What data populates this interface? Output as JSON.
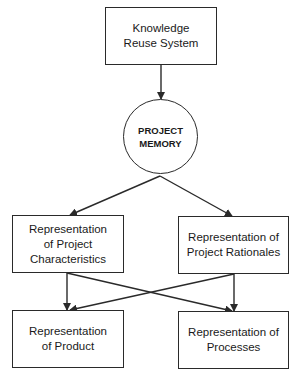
{
  "diagram": {
    "type": "flowchart",
    "stroke_color": "#2a2a2a",
    "background": "#ffffff",
    "nodes": {
      "knowledge_reuse": {
        "id": "n-kr",
        "shape": "rectangle",
        "label": "Knowledge\nReuse System"
      },
      "project_memory": {
        "id": "n-pm",
        "shape": "circle",
        "label": "PROJECT\nMEMORY"
      },
      "project_characteristics": {
        "id": "n-pc",
        "shape": "rectangle",
        "label": "Representation\nof Project\nCharacteristics"
      },
      "project_rationales": {
        "id": "n-pr",
        "shape": "rectangle",
        "label": "Representation of\nProject Rationales"
      },
      "product": {
        "id": "n-prd",
        "shape": "rectangle",
        "label": "Representation\nof Product"
      },
      "processes": {
        "id": "n-prc",
        "shape": "rectangle",
        "label": "Representation of\nProcesses"
      }
    },
    "edges": [
      {
        "from": "knowledge_reuse",
        "to": "project_memory"
      },
      {
        "from": "project_memory",
        "to": "project_characteristics"
      },
      {
        "from": "project_memory",
        "to": "project_rationales"
      },
      {
        "from": "project_characteristics",
        "to": "product"
      },
      {
        "from": "project_characteristics",
        "to": "processes"
      },
      {
        "from": "project_rationales",
        "to": "product"
      },
      {
        "from": "project_rationales",
        "to": "processes"
      }
    ]
  }
}
